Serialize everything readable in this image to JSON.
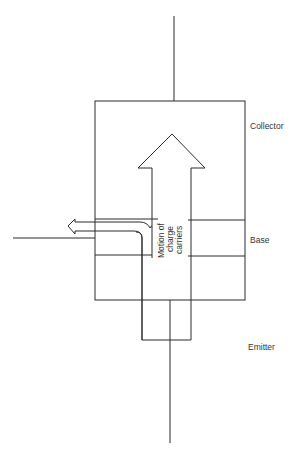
{
  "diagram": {
    "regions": [
      {
        "id": "collector",
        "label": "Collector"
      },
      {
        "id": "base",
        "label": "Base"
      },
      {
        "id": "emitter",
        "label": "Emitter"
      }
    ],
    "arrow_label": {
      "line1": "Motion of",
      "line2": "charge",
      "line3": "carriers"
    },
    "colors": {
      "line": "#2a2a2a",
      "text": "#333333",
      "background": "#ffffff"
    }
  }
}
